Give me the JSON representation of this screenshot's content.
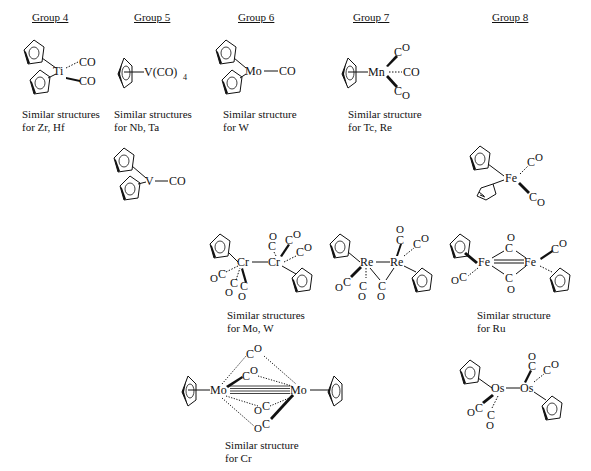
{
  "headers": [
    {
      "id": "group-4",
      "label": "Group 4",
      "x": 45
    },
    {
      "id": "group-5",
      "label": "Group 5",
      "x": 134
    },
    {
      "id": "group-6",
      "label": "Group 6",
      "x": 240
    },
    {
      "id": "group-7",
      "label": "Group 7",
      "x": 356
    },
    {
      "id": "group-8",
      "label": "Group 8",
      "x": 493
    }
  ],
  "captions": {
    "g4": "Similar structures\nfor Zr, Hf",
    "g5": "Similar structures\nfor Nb, Ta",
    "g6": "Similar structure\nfor W",
    "g7": "Similar structure\nfor Tc, Re",
    "cr2": "Similar structures\nfor Mo, W",
    "fe2": "Similar structure\nfor Ru",
    "mo2": "Similar structure\nfor Cr"
  },
  "labels": {
    "ti": "Ti",
    "v": "V",
    "v_tetra": "V(CO)",
    "sub4": "4",
    "mo": "Mo",
    "mn": "Mn",
    "fe": "Fe",
    "cr": "Cr",
    "re": "Re",
    "os": "Os",
    "co": "CO",
    "c": "C",
    "o": "O"
  },
  "compounds": [
    "Cp2Ti(CO)2",
    "CpV(CO)4",
    "Cp2V(CO)",
    "Cp2Mo(CO)",
    "CpMn(CO)3",
    "CpFe(CO)2(η1-C5H5)",
    "[CpCr(CO)3]2",
    "Cp2Re2(CO)5",
    "[CpFe(CO)2]2",
    "[CpMo(CO)2]2",
    "[CpOs(CO)2]2"
  ]
}
